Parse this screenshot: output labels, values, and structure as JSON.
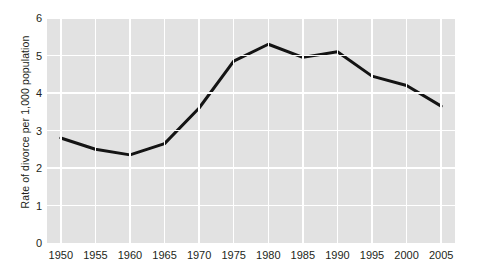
{
  "chart_data": {
    "type": "line",
    "title": "",
    "xlabel": "",
    "ylabel": "Rate of divorce per 1,000 population",
    "x": [
      1950,
      1955,
      1960,
      1965,
      1970,
      1975,
      1980,
      1985,
      1990,
      1995,
      2000,
      2005
    ],
    "values": [
      2.8,
      2.5,
      2.35,
      2.65,
      3.6,
      4.85,
      5.3,
      4.95,
      5.1,
      4.45,
      4.2,
      3.65
    ],
    "series": [
      {
        "name": "Rate of divorce per 1,000 population",
        "values": [
          2.8,
          2.5,
          2.35,
          2.65,
          3.6,
          4.85,
          5.3,
          4.95,
          5.1,
          4.45,
          4.2,
          3.65
        ]
      }
    ],
    "xlim": [
      1948,
      2007
    ],
    "ylim": [
      0,
      6
    ],
    "x_tick_labels": [
      "1950",
      "1955",
      "1960",
      "1965",
      "1970",
      "1975",
      "1980",
      "1985",
      "1990",
      "1995",
      "2000",
      "2005"
    ],
    "y_tick_labels": [
      "0",
      "1",
      "2",
      "3",
      "4",
      "5",
      "6"
    ],
    "y_ticks": [
      0,
      1,
      2,
      3,
      4,
      5,
      6
    ],
    "grid": true,
    "grid_color": "#ffffff",
    "plot_background": "#e2e2e2",
    "line_color": "#141414",
    "line_width": 3,
    "legend": false,
    "legend_position": "none",
    "annotations": []
  },
  "axis": {
    "y_title": "Rate of divorce per 1,000 population",
    "y_labels": [
      "6",
      "5",
      "4",
      "3",
      "2",
      "1",
      "0"
    ],
    "x_labels": [
      "1950",
      "1955",
      "1960",
      "1965",
      "1970",
      "1975",
      "1980",
      "1985",
      "1990",
      "1995",
      "2000",
      "2005"
    ]
  }
}
